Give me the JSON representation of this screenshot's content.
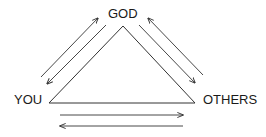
{
  "diagram": {
    "nodes": {
      "top": "GOD",
      "left": "YOU",
      "right": "OTHERS"
    },
    "edges": [
      {
        "from": "YOU",
        "to": "GOD",
        "bidirectional": true
      },
      {
        "from": "GOD",
        "to": "OTHERS",
        "bidirectional": true
      },
      {
        "from": "YOU",
        "to": "OTHERS",
        "bidirectional": true
      }
    ],
    "colors": {
      "stroke": "#333333",
      "text": "#1a1a1a",
      "background": "#ffffff"
    }
  }
}
